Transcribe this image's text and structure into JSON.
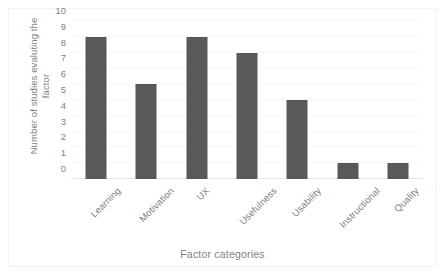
{
  "chart_data": {
    "type": "bar",
    "title": "",
    "subtitle": "",
    "xlabel": "Factor categories",
    "ylabel": "Number of studies evaluting the factor",
    "ylabel_lines": [
      "Number of studies evaluting the",
      "factor"
    ],
    "categories": [
      "Learning",
      "Motivation",
      "UX",
      "Usefulness",
      "Usability",
      "Instructional",
      "Quality"
    ],
    "values": [
      9,
      6,
      9,
      8,
      5,
      1,
      1
    ],
    "ylim": [
      0,
      10
    ],
    "ytick_labels": [
      "10",
      "9",
      "8",
      "7",
      "6",
      "5",
      "4",
      "3",
      "2",
      "1",
      "0"
    ],
    "ytick_values": [
      10,
      9,
      8,
      7,
      6,
      5,
      4,
      3,
      2,
      1,
      0
    ],
    "grid": true,
    "legend": false,
    "legend_position": "none",
    "xlabel_rotation": -45,
    "colors": {
      "bar": "#595959",
      "text": "#7f7f7f",
      "gridline": "#f7f7f7",
      "baseline": "#e6e6e6",
      "border": "#f2f2f2",
      "background": "#ffffff"
    }
  }
}
